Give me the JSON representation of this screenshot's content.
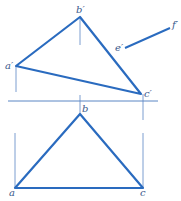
{
  "diagram": {
    "colors": {
      "edge": "#2a6bbf",
      "construction": "#5a86c4",
      "label": "#3a5a8c"
    },
    "front_view": {
      "points": {
        "a_prime": {
          "label": "a′",
          "x": 16,
          "y": 66
        },
        "b_prime": {
          "label": "b′",
          "x": 80,
          "y": 17
        },
        "c_prime": {
          "label": "c′",
          "x": 141,
          "y": 94
        },
        "e_prime": {
          "label": "e′",
          "x": 125,
          "y": 48
        },
        "f_prime": {
          "label": "f′",
          "x": 170,
          "y": 28
        }
      }
    },
    "top_view": {
      "points": {
        "a": {
          "label": "a",
          "x": 15,
          "y": 188
        },
        "b": {
          "label": "b",
          "x": 80,
          "y": 114
        },
        "c": {
          "label": "c",
          "x": 143,
          "y": 188
        }
      }
    },
    "axis": {
      "label": "X-axis",
      "y": 101,
      "x1": 8,
      "x2": 158
    }
  }
}
